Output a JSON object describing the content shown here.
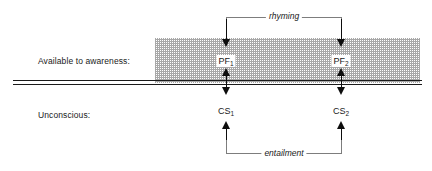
{
  "figure": {
    "background_color": "#ffffff",
    "line_color": "#1a1a1a",
    "bracket_color": "#7d7d7d",
    "band_color": "#9a9a9a"
  },
  "rows": {
    "awareness_label": "Available to awareness:",
    "unconscious_label": "Unconscious:"
  },
  "nodes": {
    "pf1": {
      "base": "PF",
      "sub": "1"
    },
    "pf2": {
      "base": "PF",
      "sub": "2"
    },
    "cs1": {
      "base": "CS",
      "sub": "1"
    },
    "cs2": {
      "base": "CS",
      "sub": "2"
    }
  },
  "relations": {
    "top_bracket_caption": "rhyming",
    "bottom_bracket_caption": "entailment"
  }
}
